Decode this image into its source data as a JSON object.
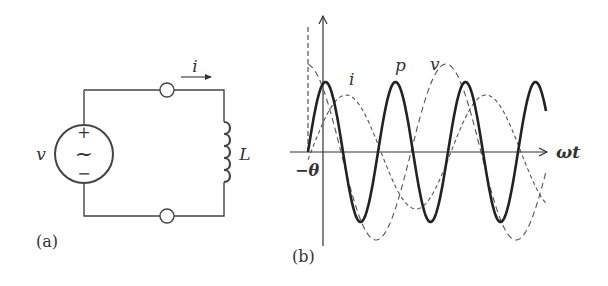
{
  "circuit": {
    "panel_label": "(a)",
    "source_label": "v",
    "source_plus": "+",
    "source_minus": "−",
    "source_symbol": "~",
    "current_label": "i",
    "inductor_label": "L"
  },
  "graph": {
    "panel_label": "(b)",
    "x_axis_label": "ωt",
    "phase_label": "−θ",
    "curve_labels": {
      "current": "i",
      "power": "p",
      "voltage": "v"
    }
  },
  "chart_data": {
    "type": "line",
    "title": "",
    "xlabel": "ωt",
    "ylabel": "",
    "annotations": [
      "−θ"
    ],
    "series": [
      {
        "name": "p",
        "style": "solid-thick",
        "description": "instantaneous power, double frequency, zero mean"
      },
      {
        "name": "v",
        "style": "dashed",
        "description": "voltage, largest amplitude, leads current by 90°"
      },
      {
        "name": "i",
        "style": "dashed",
        "description": "current, lags voltage by 90°"
      }
    ],
    "grid": false,
    "legend": "inline labels"
  },
  "colors": {
    "ink": "#2a2a2a",
    "dashed": "#555555"
  }
}
